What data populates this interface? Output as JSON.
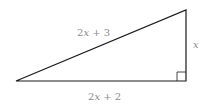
{
  "diagram": {
    "type": "right-triangle",
    "labels": {
      "hypotenuse": {
        "coef": "2",
        "var": "x",
        "rest": " + 3"
      },
      "base": {
        "coef": "2",
        "var": "x",
        "rest": " + 2"
      },
      "height": {
        "var": "x"
      }
    },
    "colors": {
      "stroke": "#1a1a1a",
      "label": "#8a8a8a",
      "background": "#ffffff"
    }
  }
}
